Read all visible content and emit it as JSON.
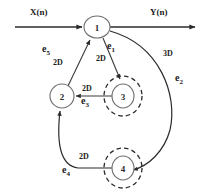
{
  "diagram": {
    "signals": {
      "input": "X(n)",
      "output": "Y(n)"
    },
    "nodes": [
      {
        "id": "1",
        "label": "1",
        "cx": 97,
        "cy": 27,
        "rx": 13,
        "ry": 11,
        "double": false
      },
      {
        "id": "2",
        "label": "2",
        "cx": 62,
        "cy": 96,
        "rx": 12,
        "ry": 12,
        "double": false
      },
      {
        "id": "3",
        "label": "3",
        "cx": 123,
        "cy": 96,
        "rx": 11,
        "ry": 12,
        "double": true
      },
      {
        "id": "4",
        "label": "4",
        "cx": 123,
        "cy": 168,
        "rx": 11,
        "ry": 12,
        "double": true
      }
    ],
    "edges": [
      {
        "id": "e1",
        "name": "e1",
        "sub": "1",
        "delay": "2D",
        "from": "1",
        "to": "3"
      },
      {
        "id": "e2",
        "name": "e2",
        "sub": "2",
        "delay": "3D",
        "from": "1",
        "to": "4"
      },
      {
        "id": "e3",
        "name": "e3",
        "sub": "3",
        "delay": "2D",
        "from": "3",
        "to": "2"
      },
      {
        "id": "e4",
        "name": "e4",
        "sub": "4",
        "delay": "2D",
        "from": "4",
        "to": "2"
      },
      {
        "id": "e5",
        "name": "e5",
        "sub": "5",
        "delay": "2D",
        "from": "2",
        "to": "1"
      }
    ],
    "labels": {
      "x_n": "X(n)",
      "y_n": "Y(n)",
      "e1": "e",
      "e1_sub": "1",
      "e1_delay": "2D",
      "e2": "e",
      "e2_sub": "2",
      "e2_delay": "3D",
      "e3": "e",
      "e3_sub": "3",
      "e3_delay": "2D",
      "e4": "e",
      "e4_sub": "4",
      "e4_delay": "2D",
      "e5": "e",
      "e5_sub": "5",
      "e5_delay": "2D",
      "n1": "1",
      "n2": "2",
      "n3": "3",
      "n4": "4"
    },
    "colors": {
      "stroke": "#2b2b2b",
      "node_stroke": "#6e6e6e",
      "background": "#ffffff"
    }
  }
}
